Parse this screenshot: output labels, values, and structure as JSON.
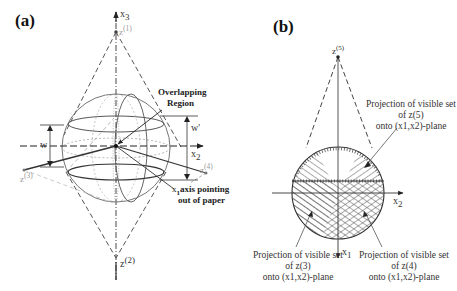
{
  "panels": [
    {
      "label": "(a)",
      "axes": {
        "x3": "x",
        "x3_sub": "3",
        "x2": "x",
        "x2_sub": "2",
        "x1": "x",
        "x1_sub": "1"
      },
      "points": {
        "z1": "z",
        "z1_sup": "(1)",
        "z2": "z",
        "z2_sup": "(2)",
        "z3": "z",
        "z3_sup": "(3)",
        "z4": "z",
        "z4_sup": "(4)"
      },
      "annotations": {
        "overlap_line1": "Overlapping",
        "overlap_line2": "Region",
        "w_left": "w",
        "w_right": "w'",
        "x1_axis_line1": "axis pointing",
        "x1_axis_line2": "out of paper"
      }
    },
    {
      "label": "(b)",
      "axes": {
        "x2": "x",
        "x2_sub": "2",
        "x1": "x",
        "x1_sub": "1"
      },
      "points": {
        "z5": "z",
        "z5_sup": "(5)"
      },
      "captions": {
        "top": [
          "Projection of visible set",
          "of z(5)",
          "onto (x1,x2)-plane"
        ],
        "left": [
          "Projection of visible set",
          "of z(3)",
          "onto (x1,x2)-plane"
        ],
        "right": [
          "Projection of visible set",
          "of z(4)",
          "onto (x1,x2)-plane"
        ]
      }
    }
  ]
}
